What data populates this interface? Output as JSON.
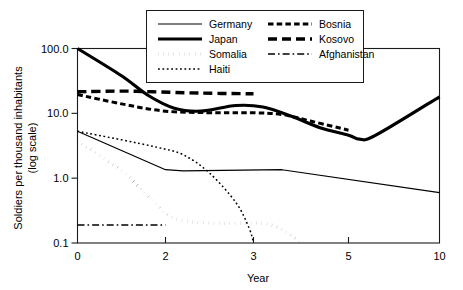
{
  "chart_data": {
    "type": "line",
    "title": "",
    "xlabel": "Year",
    "ylabel": "Soldiers  per thousand inhabitants\n(log scale)",
    "ylabel_line1": "Soldiers  per thousand inhabitants",
    "ylabel_line2": "(log scale)",
    "yscale": "log",
    "ylim": [
      0.1,
      100
    ],
    "ytick_labels": [
      "100.0",
      "10.0",
      "1.0",
      "0.1"
    ],
    "ytick_values": [
      100.0,
      10.0,
      1.0,
      0.1
    ],
    "xtick_labels": [
      "0",
      "2",
      "3",
      "5",
      "10"
    ],
    "xtick_values": [
      0,
      2,
      3,
      5,
      10
    ],
    "xscale": "piecewise-compressed",
    "grid": false,
    "legend_position": "top-center",
    "legend_columns": 2,
    "series": [
      {
        "name": "Germany",
        "style": "thin-solid",
        "x": [
          0,
          2,
          2.2,
          3.6,
          10
        ],
        "values": [
          5.3,
          1.35,
          1.3,
          1.35,
          0.6
        ]
      },
      {
        "name": "Japan",
        "style": "thick-solid",
        "x": [
          0,
          1.0,
          1.6,
          2.1,
          2.4,
          2.8,
          3.2,
          3.8,
          4.4,
          5.0,
          5.6,
          6.5,
          10
        ],
        "values": [
          100,
          38,
          19,
          12,
          10.8,
          13.2,
          12.5,
          9.0,
          6.0,
          4.6,
          4.0,
          4.6,
          18
        ]
      },
      {
        "name": "Somalia",
        "style": "thick-dotted",
        "x": [
          0,
          1.0,
          1.7,
          2.1,
          2.6,
          3.2,
          3.6,
          4.0
        ],
        "values": [
          3.7,
          1.3,
          0.45,
          0.24,
          0.2,
          0.2,
          0.16,
          0.1
        ]
      },
      {
        "name": "Haiti",
        "style": "fine-dotted",
        "x": [
          0,
          1.0,
          1.8,
          2.2,
          2.5,
          2.8,
          2.95,
          3.0
        ],
        "values": [
          5.3,
          3.9,
          3.0,
          2.3,
          1.2,
          0.42,
          0.17,
          0.1
        ]
      },
      {
        "name": "Bosnia",
        "style": "medium-dashed",
        "x": [
          0,
          1.0,
          2.0,
          2.6,
          3.0,
          3.6,
          4.2,
          5.0
        ],
        "values": [
          19.5,
          14.0,
          10.8,
          10.2,
          10.2,
          9.6,
          7.6,
          5.5
        ]
      },
      {
        "name": "Kosovo",
        "style": "long-dashed",
        "x": [
          0,
          1.0,
          1.7,
          2.4,
          3.0
        ],
        "values": [
          21.5,
          22.0,
          21.5,
          20.5,
          20.0
        ]
      },
      {
        "name": "Afghanistan",
        "style": "dash-dot",
        "x": [
          0,
          1.0,
          2.0
        ],
        "values": [
          0.19,
          0.19,
          0.19
        ]
      }
    ]
  },
  "legend": {
    "entries": [
      {
        "label": "Germany",
        "style": "thin-solid"
      },
      {
        "label": "Bosnia",
        "style": "medium-dashed"
      },
      {
        "label": "Japan",
        "style": "thick-solid"
      },
      {
        "label": "Kosovo",
        "style": "long-dashed"
      },
      {
        "label": "Somalia",
        "style": "thick-dotted"
      },
      {
        "label": "Afghanistan",
        "style": "dash-dot"
      },
      {
        "label": "Haiti",
        "style": "fine-dotted"
      }
    ]
  },
  "colors": {
    "ink": "#000000",
    "frame": "#1a1a1a",
    "background": "#ffffff"
  }
}
